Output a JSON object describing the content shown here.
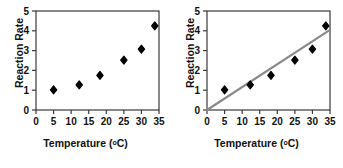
{
  "chart_data": [
    {
      "type": "scatter",
      "title": "",
      "xlabel": "Temperature (°C)",
      "ylabel": "Reaction Rate",
      "xlim": [
        0,
        35
      ],
      "ylim": [
        0,
        5
      ],
      "xticks": [
        "0",
        "5",
        "10",
        "15",
        "20",
        "25",
        "30",
        "35"
      ],
      "yticks": [
        "0",
        "1",
        "2",
        "3",
        "4",
        "5"
      ],
      "grid": false,
      "legend": "none",
      "marker": "diamond",
      "marker_color": "#000000",
      "series": [
        {
          "name": "Reaction Rate vs Temperature",
          "points": [
            {
              "x": 5.0,
              "y": 1.02
            },
            {
              "x": 12.3,
              "y": 1.27
            },
            {
              "x": 18.2,
              "y": 1.75
            },
            {
              "x": 25.0,
              "y": 2.52
            },
            {
              "x": 30.0,
              "y": 3.07
            },
            {
              "x": 33.8,
              "y": 4.25
            }
          ]
        }
      ],
      "trendline": null
    },
    {
      "type": "scatter",
      "title": "",
      "xlabel": "Temperature (°C)",
      "ylabel": "Reaction Rate",
      "xlim": [
        0,
        35
      ],
      "ylim": [
        0,
        5
      ],
      "xticks": [
        "0",
        "5",
        "10",
        "15",
        "20",
        "25",
        "30",
        "35"
      ],
      "yticks": [
        "0",
        "1",
        "2",
        "3",
        "4",
        "5"
      ],
      "grid": false,
      "legend": "none",
      "marker": "diamond",
      "marker_color": "#000000",
      "series": [
        {
          "name": "Reaction Rate vs Temperature",
          "points": [
            {
              "x": 5.0,
              "y": 1.02
            },
            {
              "x": 12.3,
              "y": 1.27
            },
            {
              "x": 18.2,
              "y": 1.75
            },
            {
              "x": 25.0,
              "y": 2.52
            },
            {
              "x": 30.0,
              "y": 3.07
            },
            {
              "x": 33.8,
              "y": 4.25
            }
          ]
        }
      ],
      "trendline": {
        "name": "line of best fit",
        "from": {
          "x": 0.0,
          "y": 0.0
        },
        "to": {
          "x": 35.0,
          "y": 4.05
        },
        "color": "#8a8a8a",
        "width": 2.2
      }
    }
  ],
  "axis_color": "#3a3a3a"
}
